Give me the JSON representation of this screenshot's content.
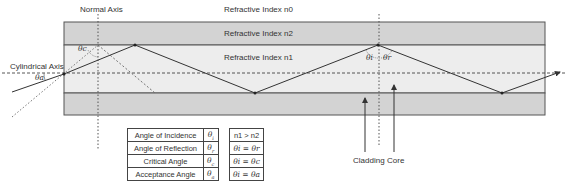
{
  "labels": {
    "normal_axis": "Normal Axis",
    "cylindrical_axis": "Cylindrical Axis",
    "n0": "Refractive Index n0",
    "n2": "Refractive Index n2",
    "n1": "Refractive Index n1",
    "cladding": "Cladding",
    "core": "Core"
  },
  "angle_labels": {
    "acceptance": "θa",
    "critical": "θc",
    "incidence": "θi",
    "reflection": "θr"
  },
  "legend_terms": {
    "rows": [
      {
        "term": "Angle of Incidence",
        "symbol": "θ",
        "sub": "i"
      },
      {
        "term": "Angle of Reflection",
        "symbol": "θ",
        "sub": "r"
      },
      {
        "term": "Critical Angle",
        "symbol": "θ",
        "sub": "c"
      },
      {
        "term": "Acceptance Angle",
        "symbol": "θ",
        "sub": "a"
      }
    ]
  },
  "legend_relations": {
    "rows": [
      "n1 > n2",
      "θi = θr",
      "θi = θc",
      "θi = θa"
    ]
  },
  "colors": {
    "cladding": "#d3d3d3",
    "core": "#ededed",
    "border": "#555555",
    "ray": "#333333"
  }
}
